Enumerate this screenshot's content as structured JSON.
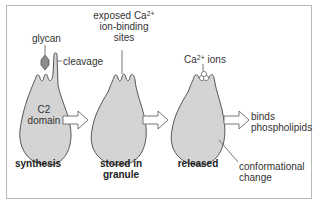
{
  "diagram": {
    "colors": {
      "cell_fill": "#d4d4d4",
      "glycan_fill": "#8c8c8c",
      "stroke": "#555555",
      "frame": "#b8b8b8"
    },
    "labels": {
      "glycan": "glycan",
      "cleavage": "cleavage",
      "c2_line1": "C2",
      "c2_line2": "domain",
      "exposed_line1": "exposed Ca",
      "exposed_sup": "2+",
      "exposed_line2": "ion-binding",
      "exposed_line3": "sites",
      "ca_ions_pre": "Ca",
      "ca_ions_sup": "2+",
      "ca_ions_post": " ions",
      "binds_line1": "binds",
      "binds_line2": "phospholipids",
      "conf_line1": "conformational",
      "conf_line2": "change"
    },
    "stages": [
      {
        "line1": "synthesis",
        "line2": ""
      },
      {
        "line1": "stored in",
        "line2": "granule"
      },
      {
        "line1": "released",
        "line2": ""
      }
    ],
    "arrows": [
      "synthesis-to-stored",
      "stored-to-released",
      "released-to-binds"
    ]
  }
}
